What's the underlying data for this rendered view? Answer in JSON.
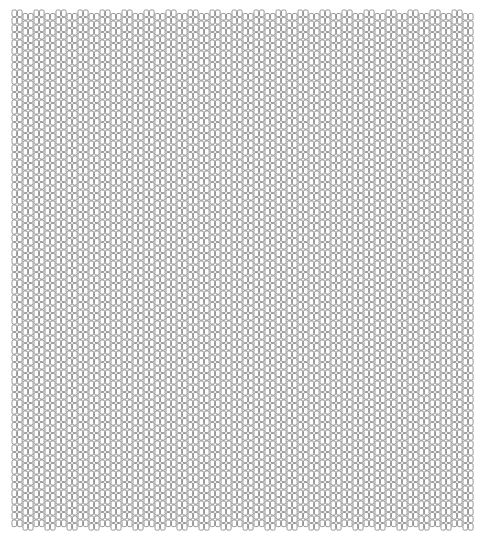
{
  "pattern": {
    "description": "Bead-weave style grid of small rounded rectangular cells",
    "origin_x": 12,
    "origin_y": 10,
    "columns": 84,
    "rows": 69,
    "col_pitch": 5.5,
    "row_pitch": 7.5,
    "cell_width": 4.6,
    "cell_height": 6.6,
    "cell_radius": 1.4,
    "group_size": 2,
    "group_offset_y": 3.5,
    "stroke_color": "#6a6a6a",
    "fill_color": "#ffffff",
    "background": "#ffffff",
    "stroke_width": 0.7
  }
}
